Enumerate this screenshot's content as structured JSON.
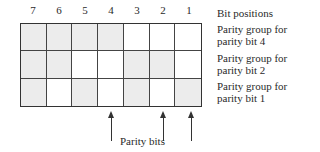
{
  "diagram": {
    "bit_positions": [
      "7",
      "6",
      "5",
      "4",
      "3",
      "2",
      "1"
    ],
    "labels": {
      "bit_positions": "Bit positions",
      "row1": [
        "Parity group for",
        "parity bit 4"
      ],
      "row2": [
        "Parity group for",
        "parity bit 2"
      ],
      "row3": [
        "Parity group for",
        "parity bit 1"
      ]
    },
    "rows": [
      {
        "parity_bit": 4,
        "shaded": [
          true,
          true,
          true,
          true,
          false,
          false,
          false
        ]
      },
      {
        "parity_bit": 2,
        "shaded": [
          true,
          true,
          false,
          false,
          true,
          true,
          false
        ]
      },
      {
        "parity_bit": 1,
        "shaded": [
          true,
          false,
          true,
          false,
          true,
          false,
          true
        ]
      }
    ],
    "parity_bit_positions": [
      "4",
      "2",
      "1"
    ],
    "caption": "Parity bits",
    "colors": {
      "shaded": "#ececec",
      "line": "#333333"
    }
  }
}
